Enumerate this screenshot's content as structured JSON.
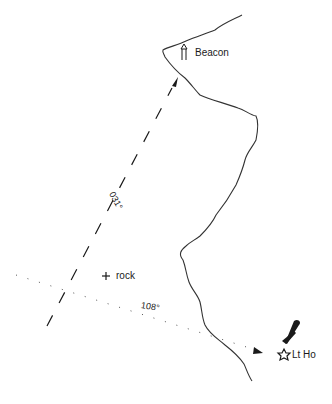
{
  "diagram": {
    "type": "navigation-bearing-plot",
    "colors": {
      "ink": "#1a1a1a",
      "background": "#ffffff"
    },
    "landmarks": {
      "beacon": {
        "label": "Beacon",
        "icon": "beacon-icon"
      },
      "lighthouse": {
        "label": "Lt Ho",
        "icon": "lighthouse-icon"
      },
      "rock": {
        "label": "rock",
        "icon": "cross-mark-icon"
      }
    },
    "bearings": [
      {
        "id": "beacon-bearing",
        "label": "031°",
        "style": "dashed",
        "target": "Beacon"
      },
      {
        "id": "lighthouse-bearing",
        "label": "108°",
        "style": "dotted",
        "target": "Lt Ho"
      }
    ]
  }
}
